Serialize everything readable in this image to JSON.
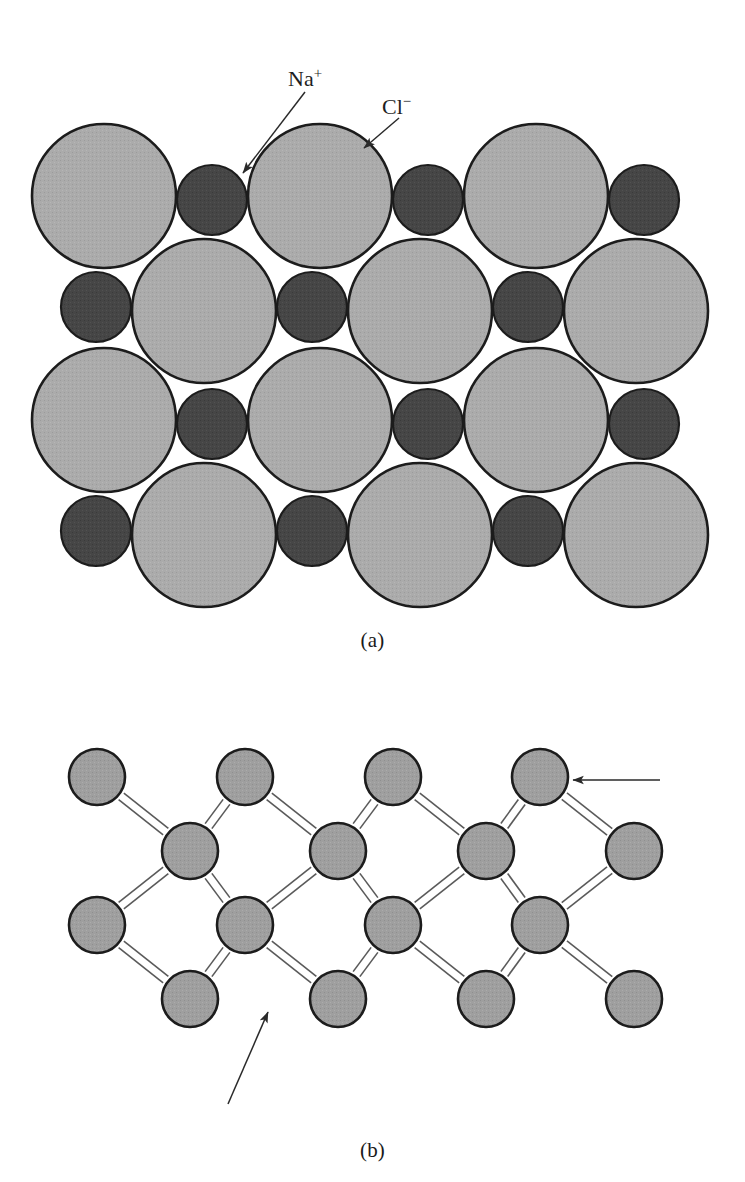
{
  "figure": {
    "title_hidden": "Schematic representations of ionic and covalent bonding",
    "background_color": "#ffffff"
  },
  "palette": {
    "anion_fill": "#a9a9a9",
    "cation_fill": "#474747",
    "atom_fill": "#9d9d9d",
    "outline": "#1c1c1c",
    "bond_line": "#5a5a5a",
    "arrow": "#2a2a2a",
    "text": "#1f1f1f"
  },
  "panel_a": {
    "caption": "(a)",
    "bonding_type": "ionic",
    "labels": [
      {
        "id": "na",
        "text": "Na",
        "charge": "+",
        "species": "sodium cation",
        "target": "small-dark-sphere"
      },
      {
        "id": "cl",
        "text": "Cl",
        "charge": "−",
        "species": "chloride anion",
        "target": "large-light-sphere"
      }
    ],
    "legend_note": "Large light spheres are Cl⁻ anions; small dark spheres are Na⁺ cations",
    "lattice": {
      "rows": 4,
      "row_pattern": [
        "anion-first",
        "cation-first",
        "anion-first",
        "cation-first"
      ],
      "anion_diameter": 144,
      "cation_diameter": 70,
      "anion_count": 12,
      "cation_count": 12
    }
  },
  "panel_b": {
    "caption": "(b)",
    "bonding_type": "covalent",
    "labels": [
      {
        "id": "si",
        "text": "Si",
        "species": "silicon atom",
        "target": "atom"
      },
      {
        "id": "two-electrons",
        "text": "Two electrons per bond",
        "target": "bond"
      }
    ],
    "lattice": {
      "rows": 4,
      "atom_diameter": 56,
      "atom_count": 18,
      "bond_style": "double-line",
      "electrons_per_bond": 2,
      "coordination": 4
    }
  },
  "chart_data": {
    "type": "diagram",
    "panels": [
      {
        "id": "a",
        "caption": "(a)",
        "description": "Ionic bonding in sodium chloride: close-packed alternating Na⁺ and Cl⁻ ions",
        "spheres": [
          {
            "row": 1,
            "cx": 104,
            "cy": 196,
            "r": 72,
            "kind": "anion",
            "label": "Cl-"
          },
          {
            "row": 1,
            "cx": 212,
            "cy": 200,
            "r": 35,
            "kind": "cation",
            "label": "Na+"
          },
          {
            "row": 1,
            "cx": 320,
            "cy": 196,
            "r": 72,
            "kind": "anion",
            "label": "Cl-"
          },
          {
            "row": 1,
            "cx": 428,
            "cy": 200,
            "r": 35,
            "kind": "cation",
            "label": "Na+"
          },
          {
            "row": 1,
            "cx": 536,
            "cy": 196,
            "r": 72,
            "kind": "anion",
            "label": "Cl-"
          },
          {
            "row": 1,
            "cx": 644,
            "cy": 200,
            "r": 35,
            "kind": "cation",
            "label": "Na+"
          },
          {
            "row": 2,
            "cx": 96,
            "cy": 307,
            "r": 35,
            "kind": "cation",
            "label": "Na+"
          },
          {
            "row": 2,
            "cx": 204,
            "cy": 311,
            "r": 72,
            "kind": "anion",
            "label": "Cl-"
          },
          {
            "row": 2,
            "cx": 312,
            "cy": 307,
            "r": 35,
            "kind": "cation",
            "label": "Na+"
          },
          {
            "row": 2,
            "cx": 420,
            "cy": 311,
            "r": 72,
            "kind": "anion",
            "label": "Cl-"
          },
          {
            "row": 2,
            "cx": 528,
            "cy": 307,
            "r": 35,
            "kind": "cation",
            "label": "Na+"
          },
          {
            "row": 2,
            "cx": 636,
            "cy": 311,
            "r": 72,
            "kind": "anion",
            "label": "Cl-"
          },
          {
            "row": 3,
            "cx": 104,
            "cy": 420,
            "r": 72,
            "kind": "anion",
            "label": "Cl-"
          },
          {
            "row": 3,
            "cx": 212,
            "cy": 424,
            "r": 35,
            "kind": "cation",
            "label": "Na+"
          },
          {
            "row": 3,
            "cx": 320,
            "cy": 420,
            "r": 72,
            "kind": "anion",
            "label": "Cl-"
          },
          {
            "row": 3,
            "cx": 428,
            "cy": 424,
            "r": 35,
            "kind": "cation",
            "label": "Na+"
          },
          {
            "row": 3,
            "cx": 536,
            "cy": 420,
            "r": 72,
            "kind": "anion",
            "label": "Cl-"
          },
          {
            "row": 3,
            "cx": 644,
            "cy": 424,
            "r": 35,
            "kind": "cation",
            "label": "Na+"
          },
          {
            "row": 4,
            "cx": 96,
            "cy": 531,
            "r": 35,
            "kind": "cation",
            "label": "Na+"
          },
          {
            "row": 4,
            "cx": 204,
            "cy": 535,
            "r": 72,
            "kind": "anion",
            "label": "Cl-"
          },
          {
            "row": 4,
            "cx": 312,
            "cy": 531,
            "r": 35,
            "kind": "cation",
            "label": "Na+"
          },
          {
            "row": 4,
            "cx": 420,
            "cy": 535,
            "r": 72,
            "kind": "anion",
            "label": "Cl-"
          },
          {
            "row": 4,
            "cx": 528,
            "cy": 531,
            "r": 35,
            "kind": "cation",
            "label": "Na+"
          },
          {
            "row": 4,
            "cx": 636,
            "cy": 535,
            "r": 72,
            "kind": "anion",
            "label": "Cl-"
          }
        ],
        "annotations": [
          {
            "id": "na",
            "text": "Na+",
            "from": [
              305,
              92
            ],
            "to": [
              243,
              173
            ]
          },
          {
            "id": "cl",
            "text": "Cl-",
            "from": [
              399,
              118
            ],
            "to": [
              364,
              148
            ]
          }
        ]
      },
      {
        "id": "b",
        "caption": "(b)",
        "description": "Covalent bonding in silicon: each Si atom shares two electrons with each of four neighbours",
        "atoms": [
          {
            "row": 1,
            "cx": 97,
            "cy": 777,
            "r": 28
          },
          {
            "row": 1,
            "cx": 245,
            "cy": 777,
            "r": 28
          },
          {
            "row": 1,
            "cx": 393,
            "cy": 777,
            "r": 28
          },
          {
            "row": 1,
            "cx": 540,
            "cy": 777,
            "r": 28
          },
          {
            "row": 2,
            "cx": 190,
            "cy": 851,
            "r": 28
          },
          {
            "row": 2,
            "cx": 338,
            "cy": 851,
            "r": 28
          },
          {
            "row": 2,
            "cx": 486,
            "cy": 851,
            "r": 28
          },
          {
            "row": 2,
            "cx": 634,
            "cy": 851,
            "r": 28
          },
          {
            "row": 3,
            "cx": 97,
            "cy": 925,
            "r": 28
          },
          {
            "row": 3,
            "cx": 245,
            "cy": 925,
            "r": 28
          },
          {
            "row": 3,
            "cx": 393,
            "cy": 925,
            "r": 28
          },
          {
            "row": 3,
            "cx": 540,
            "cy": 925,
            "r": 28
          },
          {
            "row": 4,
            "cx": 190,
            "cy": 999,
            "r": 28
          },
          {
            "row": 4,
            "cx": 338,
            "cy": 999,
            "r": 28
          },
          {
            "row": 4,
            "cx": 486,
            "cy": 999,
            "r": 28
          },
          {
            "row": 4,
            "cx": 634,
            "cy": 999,
            "r": 28
          }
        ],
        "annotations": [
          {
            "id": "si",
            "text": "Si",
            "from": [
              660,
              780
            ],
            "to": [
              573,
              780
            ]
          },
          {
            "id": "two-electrons",
            "text": "Two electrons per bond",
            "from": [
              228,
              1104
            ],
            "to": [
              268,
              1012
            ]
          }
        ]
      }
    ]
  }
}
